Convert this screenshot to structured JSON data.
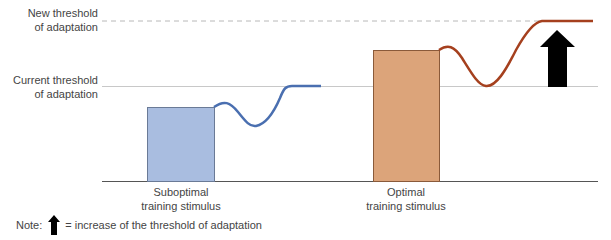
{
  "diagram": {
    "thresholds": {
      "new_label_line1": "New threshold",
      "new_label_line2": "of adaptation",
      "current_label_line1": "Current threshold",
      "current_label_line2": "of adaptation"
    },
    "stimuli": [
      {
        "label_line1": "Suboptimal",
        "label_line2": "training stimulus",
        "color": "#a9bde0",
        "curve_color": "#4a6fb0"
      },
      {
        "label_line1": "Optimal",
        "label_line2": "training stimulus",
        "color": "#dca47a",
        "curve_color": "#a5401e"
      }
    ],
    "arrow_color": "#000000",
    "note": {
      "prefix": "Note:",
      "text": "= increase of the threshold of adaptation"
    }
  }
}
